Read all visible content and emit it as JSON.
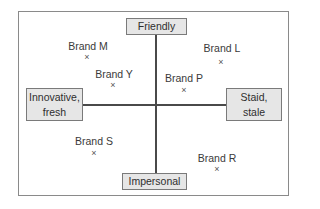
{
  "diagram": {
    "type": "perceptual-map",
    "poles": {
      "top": "Friendly",
      "bottom": "Impersonal",
      "left": "Innovative,\nfresh",
      "right": "Staid,\nstale"
    },
    "brands": [
      {
        "label": "Brand M",
        "quadrant": "friendly-innovative"
      },
      {
        "label": "Brand Y",
        "quadrant": "friendly-innovative"
      },
      {
        "label": "Brand L",
        "quadrant": "friendly-staid"
      },
      {
        "label": "Brand P",
        "quadrant": "friendly-staid"
      },
      {
        "label": "Brand S",
        "quadrant": "impersonal-innovative"
      },
      {
        "label": "Brand R",
        "quadrant": "impersonal-staid"
      }
    ],
    "marker_glyph": "×"
  },
  "colors": {
    "frame": "#8a8a8a",
    "axis": "#4a4a4a",
    "pole_fill": "#e6e6e6",
    "pole_border": "#7a7a7a",
    "text": "#333333"
  }
}
